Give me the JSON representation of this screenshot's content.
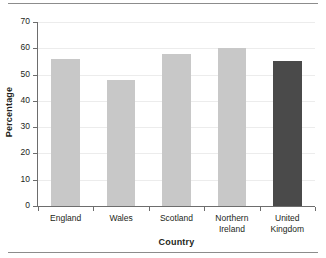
{
  "chart_data": {
    "type": "bar",
    "title": "",
    "subtitle": "",
    "xlabel": "Country",
    "ylabel": "Percentage",
    "categories": [
      "England",
      "Wales",
      "Scotland",
      "Northern Ireland",
      "United Kingdom"
    ],
    "category_lines": [
      [
        "England"
      ],
      [
        "Wales"
      ],
      [
        "Scotland"
      ],
      [
        "Northern",
        "Ireland"
      ],
      [
        "United",
        "Kingdom"
      ]
    ],
    "values": [
      56,
      48,
      58,
      60,
      55
    ],
    "ylim": [
      0,
      70
    ],
    "ytick_values": [
      0,
      10,
      20,
      30,
      40,
      50,
      60,
      70
    ],
    "ytick_labels": [
      "0",
      "10",
      "20",
      "30",
      "40",
      "50",
      "60",
      "70"
    ],
    "grid": true,
    "grid_axis": "y",
    "legend": false,
    "legend_position": "none",
    "bar_colors": [
      "#c8c8c8",
      "#c8c8c8",
      "#c8c8c8",
      "#c8c8c8",
      "#4a4a4a"
    ],
    "annotations": []
  },
  "style": {
    "default_bar_color": "#c8c8c8",
    "highlight_bar_color": "#4a4a4a",
    "axis_color": "#6d6d6d",
    "grid_color": "#ececec",
    "text_color": "#231f20",
    "rule_color": "#8c8c8c",
    "background": "#ffffff"
  },
  "decoration": {
    "top_rule": "horizontal-rule",
    "bottom_rule": "horizontal-rule"
  }
}
